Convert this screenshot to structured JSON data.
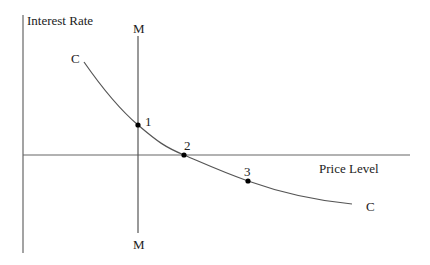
{
  "diagram": {
    "y_axis_label": "Interest Rate",
    "x_axis_label": "Price Level",
    "m_line": {
      "top_label": "M",
      "bottom_label": "M"
    },
    "curve": {
      "start_label": "C",
      "end_label": "C"
    },
    "points": [
      {
        "label": "1"
      },
      {
        "label": "2"
      },
      {
        "label": "3"
      }
    ],
    "colors": {
      "line": "#555555",
      "text": "#222222",
      "point": "#000000"
    }
  }
}
